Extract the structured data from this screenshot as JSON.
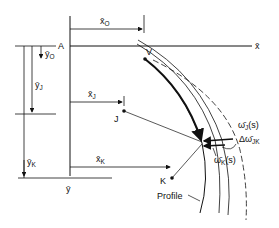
{
  "figure": {
    "axes": {
      "origin_label": "A",
      "x_axis_label": "x̄",
      "y_axis_label": "ȳ"
    },
    "points": {
      "V": "V",
      "J": "J",
      "K": "K"
    },
    "dimensions": {
      "x0": "x̄",
      "x0_sub": "O",
      "y0": "ȳ",
      "y0_sub": "O",
      "xJ": "x̄",
      "xJ_sub": "J",
      "yJ": "ȳ",
      "yJ_sub": "J",
      "xK": "x̄",
      "xK_sub": "K",
      "yK": "ȳ",
      "yK_sub": "K"
    },
    "annotations": {
      "wJ": "ω̄",
      "wJ_sub": "J",
      "wJ_arg": "(s)",
      "dwJK": "Δω̄",
      "dwJK_sub": "JK",
      "wK": "ω̄",
      "wK_sub": "K",
      "wK_arg": "(s)",
      "profile": "Profile"
    }
  }
}
